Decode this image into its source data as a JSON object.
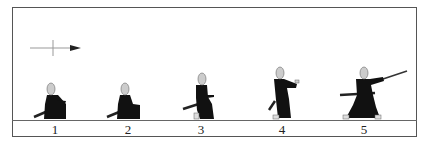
{
  "figure": {
    "title": "",
    "direction_indicator": "arrow-right",
    "frames": [
      {
        "label": "1",
        "pose": "seated-seiza",
        "x": 55
      },
      {
        "label": "2",
        "pose": "seated-rising",
        "x": 128
      },
      {
        "label": "3",
        "pose": "kneeling-draw",
        "x": 202
      },
      {
        "label": "4",
        "pose": "rising-draw",
        "x": 281
      },
      {
        "label": "5",
        "pose": "standing-cut",
        "x": 364
      }
    ],
    "colors": {
      "figure": "#111111",
      "head": "#cccccc",
      "line": "#555555",
      "ground": "#666666"
    }
  }
}
